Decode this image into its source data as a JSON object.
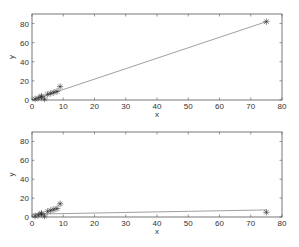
{
  "chart_data": [
    {
      "type": "scatter",
      "title": "",
      "xlabel": "x",
      "ylabel": "y",
      "xlim": [
        0,
        80
      ],
      "ylim": [
        0,
        90
      ],
      "xticks": [
        0,
        10,
        20,
        30,
        40,
        50,
        60,
        70,
        80
      ],
      "yticks": [
        0,
        20,
        40,
        60,
        80
      ],
      "grid": false,
      "marker": "*",
      "points": {
        "x": [
          1,
          2,
          3,
          3,
          4,
          5,
          6,
          7,
          8,
          9,
          75
        ],
        "y": [
          1,
          2,
          3,
          4,
          1,
          6,
          7,
          8,
          9,
          14,
          82
        ]
      },
      "fit_line": {
        "x": [
          0,
          75
        ],
        "y": [
          0,
          82
        ]
      }
    },
    {
      "type": "scatter",
      "title": "",
      "xlabel": "x",
      "ylabel": "y",
      "xlim": [
        0,
        80
      ],
      "ylim": [
        0,
        90
      ],
      "xticks": [
        0,
        10,
        20,
        30,
        40,
        50,
        60,
        70,
        80
      ],
      "yticks": [
        0,
        20,
        40,
        60,
        80
      ],
      "grid": false,
      "marker": "*",
      "points": {
        "x": [
          1,
          2,
          3,
          3,
          4,
          5,
          6,
          7,
          8,
          9,
          75
        ],
        "y": [
          1,
          2,
          3,
          4,
          1,
          6,
          7,
          8,
          9,
          14,
          5
        ]
      },
      "fit_line": {
        "x": [
          0,
          75
        ],
        "y": [
          3,
          7.5
        ]
      }
    }
  ],
  "colors": {
    "axis": "#555555",
    "line": "#777777",
    "marker": "#222222"
  }
}
